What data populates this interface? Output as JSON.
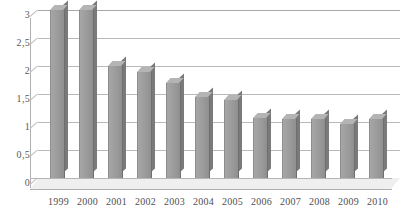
{
  "chart_data": {
    "type": "bar",
    "title": "",
    "subtitle": "",
    "xlabel": "",
    "ylabel": "",
    "categories": [
      "1999",
      "2000",
      "2001",
      "2002",
      "2003",
      "2004",
      "2005",
      "2006",
      "2007",
      "2008",
      "2009",
      "2010"
    ],
    "values": [
      3.0,
      3.0,
      2.0,
      1.9,
      1.7,
      1.45,
      1.4,
      1.08,
      1.05,
      1.05,
      0.97,
      1.05
    ],
    "series": [
      {
        "name": "",
        "values": [
          3.0,
          3.0,
          2.0,
          1.9,
          1.7,
          1.45,
          1.4,
          1.08,
          1.05,
          1.05,
          0.97,
          1.05
        ]
      }
    ],
    "ylim": [
      0,
      3
    ],
    "ytick_labels": [
      "3",
      "2,5",
      "2",
      "1,5",
      "1",
      "0,5",
      "0"
    ],
    "ytick_values": [
      3,
      2.5,
      2,
      1.5,
      1,
      0.5,
      0
    ],
    "grid": true,
    "legend": false,
    "legend_position": "none",
    "style": "3d-column",
    "colors": {
      "bar_face": "#9d9d9d",
      "bar_top": "#b4b4b4",
      "bar_side": "#7a7a7a",
      "gridline": "#b9b9b9",
      "axis": "#b0b0b0",
      "floor": "#efefef",
      "text": "#4f4f4f",
      "background": "#ffffff"
    }
  }
}
